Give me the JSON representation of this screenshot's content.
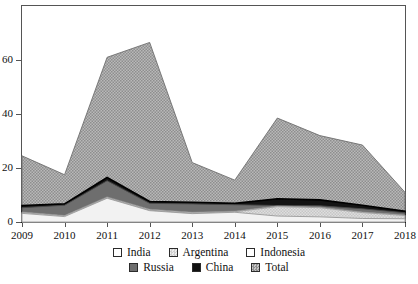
{
  "figure": {
    "title_fragment": "",
    "background": "#ffffff"
  },
  "axes": {
    "y": {
      "ticks": [
        "0",
        "20",
        "40",
        "60"
      ],
      "tick_values": [
        0,
        20,
        40,
        60
      ],
      "min": 0,
      "max": 80
    },
    "x": {
      "ticks": [
        "2009",
        "2010",
        "2011",
        "2012",
        "2013",
        "2014",
        "2015",
        "2016",
        "2017",
        "2018"
      ]
    }
  },
  "legend": {
    "rows": [
      [
        {
          "label": "India",
          "swatch": "india-swatch",
          "color": "#ffffff"
        },
        {
          "label": "Argentina",
          "swatch": "argentina-swatch",
          "color": "#d0d0d0"
        },
        {
          "label": "Indonesia",
          "swatch": "indonesia-swatch",
          "color": "#ffffff"
        }
      ],
      [
        {
          "label": "Russia",
          "swatch": "russia-swatch",
          "color": "#6e6e6e"
        },
        {
          "label": "China",
          "swatch": "china-swatch",
          "color": "#111111"
        },
        {
          "label": "Total",
          "swatch": "total-swatch",
          "color": "#b5b5b5"
        }
      ]
    ]
  },
  "colors": {
    "india": "#f2f2f2",
    "argentina": "#d8d8d8",
    "indonesia": "#ffffff",
    "russia": "#6e6e6e",
    "china": "#141414",
    "total": "#a8a8a8",
    "axis": "#555555",
    "text": "#111111"
  },
  "chart_data": {
    "type": "area",
    "stacked": true,
    "title": "",
    "xlabel": "",
    "ylabel": "",
    "xlim": [
      2009,
      2018
    ],
    "ylim": [
      0,
      80
    ],
    "grid": false,
    "legend_position": "bottom",
    "categories": [
      2009,
      2010,
      2011,
      2012,
      2013,
      2014,
      2015,
      2016,
      2017,
      2018
    ],
    "series": [
      {
        "name": "India",
        "values": [
          3.2,
          2.0,
          8.8,
          4.2,
          3.1,
          3.6,
          2.2,
          1.9,
          1.3,
          1.2
        ]
      },
      {
        "name": "Argentina",
        "values": [
          0.3,
          0.2,
          0.2,
          0.2,
          0.2,
          0.2,
          3.5,
          3.4,
          2.2,
          1.2
        ]
      },
      {
        "name": "Indonesia",
        "values": [
          0.2,
          0.2,
          0.3,
          0.3,
          0.3,
          0.2,
          0.2,
          0.2,
          0.2,
          0.2
        ]
      },
      {
        "name": "Russia",
        "values": [
          1.6,
          3.8,
          6.0,
          2.2,
          3.1,
          2.4,
          0.2,
          0.5,
          1.2,
          0.8
        ]
      },
      {
        "name": "China",
        "values": [
          0.8,
          0.5,
          1.2,
          0.7,
          0.6,
          0.5,
          2.5,
          2.2,
          1.3,
          0.6
        ]
      },
      {
        "name": "Total",
        "values": [
          24.5,
          17.5,
          61.0,
          66.5,
          22.0,
          15.5,
          38.5,
          32.0,
          28.5,
          11.0
        ]
      }
    ],
    "stack_tops": {
      "comment": "cumulative upper boundary of each band, bottom-to-top, per year",
      "india": [
        3.2,
        2.0,
        8.8,
        4.2,
        3.1,
        3.6,
        2.2,
        1.9,
        1.3,
        1.2
      ],
      "argentina": [
        3.5,
        2.2,
        9.0,
        4.4,
        3.3,
        3.8,
        5.7,
        5.3,
        3.5,
        2.4
      ],
      "indonesia": [
        3.7,
        2.4,
        9.3,
        4.7,
        3.6,
        4.0,
        5.9,
        5.5,
        3.7,
        2.6
      ],
      "russia": [
        5.3,
        6.2,
        15.3,
        6.9,
        6.7,
        6.4,
        6.1,
        6.0,
        4.9,
        3.4
      ],
      "china": [
        6.1,
        6.7,
        16.5,
        7.6,
        7.3,
        6.9,
        8.6,
        8.2,
        6.2,
        4.0
      ],
      "total": [
        24.5,
        17.5,
        61.0,
        66.5,
        22.0,
        15.5,
        38.5,
        32.0,
        28.5,
        11.0
      ]
    }
  }
}
